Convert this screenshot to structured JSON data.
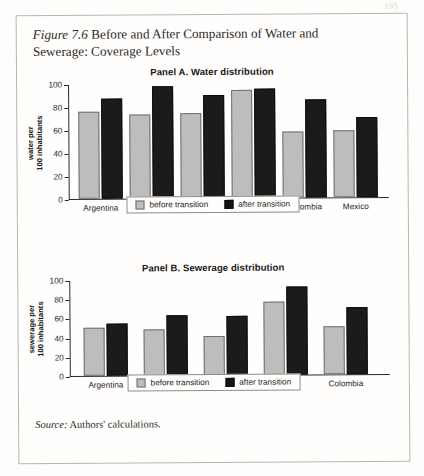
{
  "page": {
    "page_number": "195"
  },
  "figure": {
    "number_label": "Figure 7.6",
    "caption": "Before and After Comparison of Water and Sewerage: Coverage Levels",
    "source_label": "Source:",
    "source_text": "Authors' calculations."
  },
  "legend": {
    "before_label": "before transition",
    "after_label": "after transition",
    "before_color": "#bdbdbd",
    "after_color": "#141414"
  },
  "chart_data": [
    {
      "type": "bar",
      "panel_id": "Panel A",
      "title": "Panel A. Water distribution",
      "ylabel_line1": "water per",
      "ylabel_line2": "100 inhabitants",
      "xlabel": "",
      "ylim": [
        0,
        100
      ],
      "yticks": [
        0,
        20,
        40,
        60,
        80,
        100
      ],
      "ytick_labels": [
        "0",
        "20",
        "40",
        "60",
        "80",
        "100"
      ],
      "grid": false,
      "legend_position": "bottom-center",
      "categories": [
        "Argentina",
        "Bolivia",
        "Brazil",
        "Chile",
        "Colombia",
        "Mexico"
      ],
      "series": [
        {
          "name": "before transition",
          "color": "#bdbdbd",
          "values": [
            76,
            73,
            74,
            94,
            57,
            58
          ]
        },
        {
          "name": "after transition",
          "color": "#141414",
          "values": [
            87,
            97,
            90,
            95,
            85,
            70
          ]
        }
      ]
    },
    {
      "type": "bar",
      "panel_id": "Panel B",
      "title": "Panel B. Sewerage distribution",
      "ylabel_line1": "sewerage per",
      "ylabel_line2": "100 inhabitants",
      "xlabel": "",
      "ylim": [
        0,
        100
      ],
      "yticks": [
        0,
        20,
        40,
        60,
        80,
        100
      ],
      "ytick_labels": [
        "0",
        "20",
        "40",
        "60",
        "80",
        "100"
      ],
      "grid": false,
      "legend_position": "bottom-center",
      "categories": [
        "Argentina",
        "Bolivia",
        "Brazil",
        "Chile",
        "Colombia"
      ],
      "series": [
        {
          "name": "before transition",
          "color": "#bdbdbd",
          "values": [
            50,
            48,
            41,
            76,
            50
          ]
        },
        {
          "name": "after transition",
          "color": "#141414",
          "values": [
            54,
            62,
            61,
            92,
            70
          ]
        }
      ]
    }
  ]
}
